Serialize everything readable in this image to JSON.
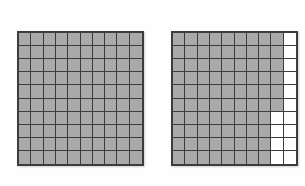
{
  "figure": {
    "type": "hundredths-grid-pair",
    "background_color": "#fefefe",
    "shaded_color": "#a9a9a9",
    "unshaded_color": "#ffffff",
    "gridline_color": "#3c3c3c",
    "border_color": "#3c3c3c"
  },
  "grids": [
    {
      "id": "grid-left",
      "name": "left-grid",
      "rows": 10,
      "columns": 10,
      "total_cells": 100,
      "shaded_count": 100,
      "unshaded_count": 0,
      "shaded_fraction": "100/100",
      "shaded_decimal": "1.00",
      "shaded_percent": "100%",
      "shaded_rows": [
        10,
        10,
        10,
        10,
        10,
        10,
        10,
        10,
        10,
        10
      ]
    },
    {
      "id": "grid-right",
      "name": "right-grid",
      "rows": 10,
      "columns": 10,
      "total_cells": 100,
      "shaded_count": 84,
      "unshaded_count": 16,
      "shaded_fraction": "84/100",
      "shaded_decimal": "0.84",
      "shaded_percent": "84%",
      "shaded_rows": [
        9,
        9,
        9,
        9,
        9,
        9,
        8,
        8,
        8,
        8
      ]
    }
  ],
  "chart_data": {
    "type": "heatmap",
    "title": "",
    "xlabel": "",
    "ylabel": "",
    "grid": true,
    "legend": "none",
    "panels": [
      {
        "name": "left-grid",
        "rows": 10,
        "columns": 10,
        "value_labels": [
          "unshaded",
          "shaded"
        ],
        "values": [
          [
            1,
            1,
            1,
            1,
            1,
            1,
            1,
            1,
            1,
            1
          ],
          [
            1,
            1,
            1,
            1,
            1,
            1,
            1,
            1,
            1,
            1
          ],
          [
            1,
            1,
            1,
            1,
            1,
            1,
            1,
            1,
            1,
            1
          ],
          [
            1,
            1,
            1,
            1,
            1,
            1,
            1,
            1,
            1,
            1
          ],
          [
            1,
            1,
            1,
            1,
            1,
            1,
            1,
            1,
            1,
            1
          ],
          [
            1,
            1,
            1,
            1,
            1,
            1,
            1,
            1,
            1,
            1
          ],
          [
            1,
            1,
            1,
            1,
            1,
            1,
            1,
            1,
            1,
            1
          ],
          [
            1,
            1,
            1,
            1,
            1,
            1,
            1,
            1,
            1,
            1
          ],
          [
            1,
            1,
            1,
            1,
            1,
            1,
            1,
            1,
            1,
            1
          ],
          [
            1,
            1,
            1,
            1,
            1,
            1,
            1,
            1,
            1,
            1
          ]
        ],
        "shaded_total": 100
      },
      {
        "name": "right-grid",
        "rows": 10,
        "columns": 10,
        "value_labels": [
          "unshaded",
          "shaded"
        ],
        "values": [
          [
            1,
            1,
            1,
            1,
            1,
            1,
            1,
            1,
            1,
            0
          ],
          [
            1,
            1,
            1,
            1,
            1,
            1,
            1,
            1,
            1,
            0
          ],
          [
            1,
            1,
            1,
            1,
            1,
            1,
            1,
            1,
            1,
            0
          ],
          [
            1,
            1,
            1,
            1,
            1,
            1,
            1,
            1,
            1,
            0
          ],
          [
            1,
            1,
            1,
            1,
            1,
            1,
            1,
            1,
            1,
            0
          ],
          [
            1,
            1,
            1,
            1,
            1,
            1,
            1,
            1,
            1,
            0
          ],
          [
            1,
            1,
            1,
            1,
            1,
            1,
            1,
            1,
            0,
            0
          ],
          [
            1,
            1,
            1,
            1,
            1,
            1,
            1,
            1,
            0,
            0
          ],
          [
            1,
            1,
            1,
            1,
            1,
            1,
            1,
            1,
            0,
            0
          ],
          [
            1,
            1,
            1,
            1,
            1,
            1,
            1,
            1,
            0,
            0
          ]
        ],
        "shaded_total": 84
      }
    ]
  }
}
